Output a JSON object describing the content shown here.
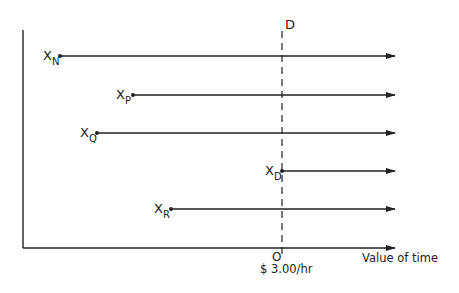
{
  "diagram": {
    "colors": {
      "ink": "#222222",
      "background": "#ffffff"
    },
    "axes": {
      "x_label": "Value of time",
      "origin_label": "O",
      "origin_value_label": "$ 3.00/hr"
    },
    "divider": {
      "label": "D",
      "style": "dashed"
    },
    "rays": [
      {
        "id": "N",
        "base": "X",
        "sub": "N",
        "start_x": 60,
        "y": 56
      },
      {
        "id": "P",
        "base": "X",
        "sub": "P",
        "start_x": 133,
        "y": 95
      },
      {
        "id": "Q",
        "base": "X",
        "sub": "Q",
        "start_x": 97,
        "y": 133
      },
      {
        "id": "D",
        "base": "X",
        "sub": "D",
        "start_x": 282,
        "y": 171
      },
      {
        "id": "R",
        "base": "X",
        "sub": "R",
        "start_x": 171,
        "y": 209
      }
    ]
  }
}
